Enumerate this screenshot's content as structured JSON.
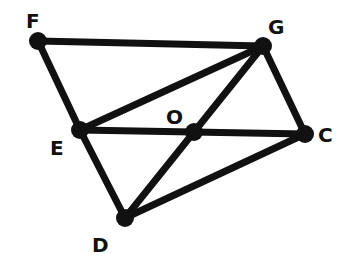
{
  "diagram": {
    "points": {
      "F": {
        "label": "F",
        "x": 38,
        "y": 41,
        "lx": 26,
        "ly": 28
      },
      "G": {
        "label": "G",
        "x": 263,
        "y": 46,
        "lx": 268,
        "ly": 34
      },
      "E": {
        "label": "E",
        "x": 80,
        "y": 130,
        "lx": 50,
        "ly": 155
      },
      "O": {
        "label": "O",
        "x": 194,
        "y": 132,
        "lx": 166,
        "ly": 124
      },
      "C": {
        "label": "C",
        "x": 305,
        "y": 134,
        "lx": 318,
        "ly": 142
      },
      "D": {
        "label": "D",
        "x": 125,
        "y": 218,
        "lx": 92,
        "ly": 252
      }
    },
    "segments": [
      [
        "F",
        "G"
      ],
      [
        "F",
        "E"
      ],
      [
        "E",
        "G"
      ],
      [
        "E",
        "C"
      ],
      [
        "G",
        "C"
      ],
      [
        "E",
        "D"
      ],
      [
        "D",
        "G"
      ],
      [
        "D",
        "C"
      ]
    ],
    "stroke_color": "#111111"
  }
}
